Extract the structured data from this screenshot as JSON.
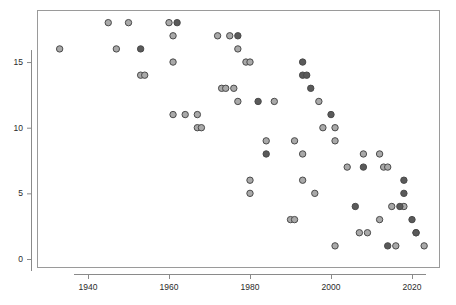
{
  "chart_data": {
    "type": "scatter",
    "title": "",
    "subtitle": "",
    "xlabel": "",
    "ylabel": "",
    "xlim": [
      1929,
      2026
    ],
    "ylim": [
      -0.4,
      18.8
    ],
    "grid": false,
    "legend": null,
    "xticks": [
      1940,
      1960,
      1980,
      2000,
      2020
    ],
    "xtick_labels": [
      "1940",
      "1960",
      "1980",
      "2000",
      "2020"
    ],
    "yticks": [
      0,
      5,
      10,
      15
    ],
    "ytick_labels": [
      "0",
      "5",
      "10",
      "15"
    ],
    "marker": {
      "shape": "circle",
      "radius": 3.2,
      "light_fill": "#a9a9a9",
      "dark_fill": "#5a5a5a",
      "edge": "#4a4a4a"
    },
    "series": [
      {
        "name": "light",
        "fill": "#a9a9a9",
        "points": [
          [
            1933,
            16
          ],
          [
            1945,
            18
          ],
          [
            1947,
            16
          ],
          [
            1950,
            18
          ],
          [
            1953,
            14
          ],
          [
            1954,
            14
          ],
          [
            1960,
            18
          ],
          [
            1961,
            17
          ],
          [
            1961,
            15
          ],
          [
            1961,
            11
          ],
          [
            1964,
            11
          ],
          [
            1967,
            11
          ],
          [
            1967,
            10
          ],
          [
            1968,
            10
          ],
          [
            1972,
            17
          ],
          [
            1973,
            13
          ],
          [
            1974,
            13
          ],
          [
            1975,
            17
          ],
          [
            1976,
            13
          ],
          [
            1977,
            16
          ],
          [
            1977,
            12
          ],
          [
            1979,
            15
          ],
          [
            1980,
            15
          ],
          [
            1980,
            6
          ],
          [
            1980,
            5
          ],
          [
            1984,
            9
          ],
          [
            1986,
            12
          ],
          [
            1990,
            3
          ],
          [
            1991,
            3
          ],
          [
            1991,
            9
          ],
          [
            1993,
            8
          ],
          [
            1993,
            6
          ],
          [
            1996,
            5
          ],
          [
            1997,
            12
          ],
          [
            1998,
            10
          ],
          [
            2001,
            10
          ],
          [
            2001,
            9
          ],
          [
            2001,
            1
          ],
          [
            2004,
            7
          ],
          [
            2007,
            2
          ],
          [
            2008,
            8
          ],
          [
            2009,
            2
          ],
          [
            2012,
            8
          ],
          [
            2012,
            3
          ],
          [
            2013,
            7
          ],
          [
            2014,
            7
          ],
          [
            2015,
            4
          ],
          [
            2016,
            1
          ],
          [
            2018,
            4
          ],
          [
            2021,
            2
          ],
          [
            2023,
            1
          ]
        ]
      },
      {
        "name": "dark",
        "fill": "#5a5a5a",
        "points": [
          [
            1953,
            16
          ],
          [
            1962,
            18
          ],
          [
            1977,
            17
          ],
          [
            1982,
            12
          ],
          [
            1984,
            8
          ],
          [
            1993,
            15
          ],
          [
            1993,
            14
          ],
          [
            1994,
            14
          ],
          [
            1995,
            13
          ],
          [
            2000,
            11
          ],
          [
            2008,
            7
          ],
          [
            2014,
            1
          ],
          [
            2017,
            4
          ],
          [
            2018,
            6
          ],
          [
            2018,
            5
          ],
          [
            2020,
            3
          ],
          [
            2021,
            2
          ],
          [
            2006,
            4
          ]
        ]
      }
    ]
  },
  "plot_geometry": {
    "frame_left": 37,
    "frame_top": 10,
    "frame_right": 440,
    "frame_bottom": 268,
    "x_pixel_1940": 88,
    "x_pixel_per_year": 4.05,
    "y_pixel_0": 259,
    "y_pixel_per_unit": 13.13
  }
}
